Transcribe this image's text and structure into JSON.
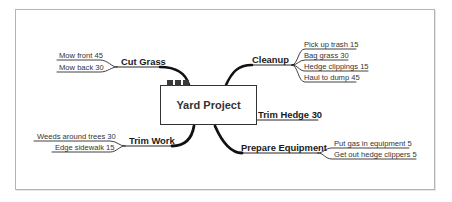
{
  "diagram": {
    "type": "mind-map",
    "central_topic": {
      "label": "Yard Project",
      "markers": [
        "task-box",
        "task-box",
        "task-box"
      ]
    },
    "colors": {
      "line": "#111111",
      "text": "#222222",
      "frame": "#b4b4b4",
      "marker": "#3a3a3a"
    },
    "branches": [
      {
        "id": "cut-grass",
        "label": "Cut Grass",
        "side": "left",
        "children": [
          {
            "label": "Mow front  45"
          },
          {
            "label": "Mow back  30"
          }
        ]
      },
      {
        "id": "cleanup",
        "label": "Cleanup",
        "side": "right",
        "children": [
          {
            "label": "Pick up trash  15"
          },
          {
            "label": "Bag grass  30"
          },
          {
            "label": "Hedge clippings  15"
          },
          {
            "label": "Haul to dump  45"
          }
        ]
      },
      {
        "id": "trim-hedge",
        "label": "Trim Hedge  30",
        "side": "right",
        "children": []
      },
      {
        "id": "prepare-equipment",
        "label": "Prepare Equipment",
        "side": "right",
        "children": [
          {
            "label": "Put gas in equipment  5"
          },
          {
            "label": "Get out hedge clippers 5"
          }
        ]
      },
      {
        "id": "trim-work",
        "label": "Trim Work",
        "side": "left",
        "children": [
          {
            "label": "Weeds around trees  30"
          },
          {
            "label": "Edge sidewalk  15"
          }
        ]
      }
    ]
  }
}
